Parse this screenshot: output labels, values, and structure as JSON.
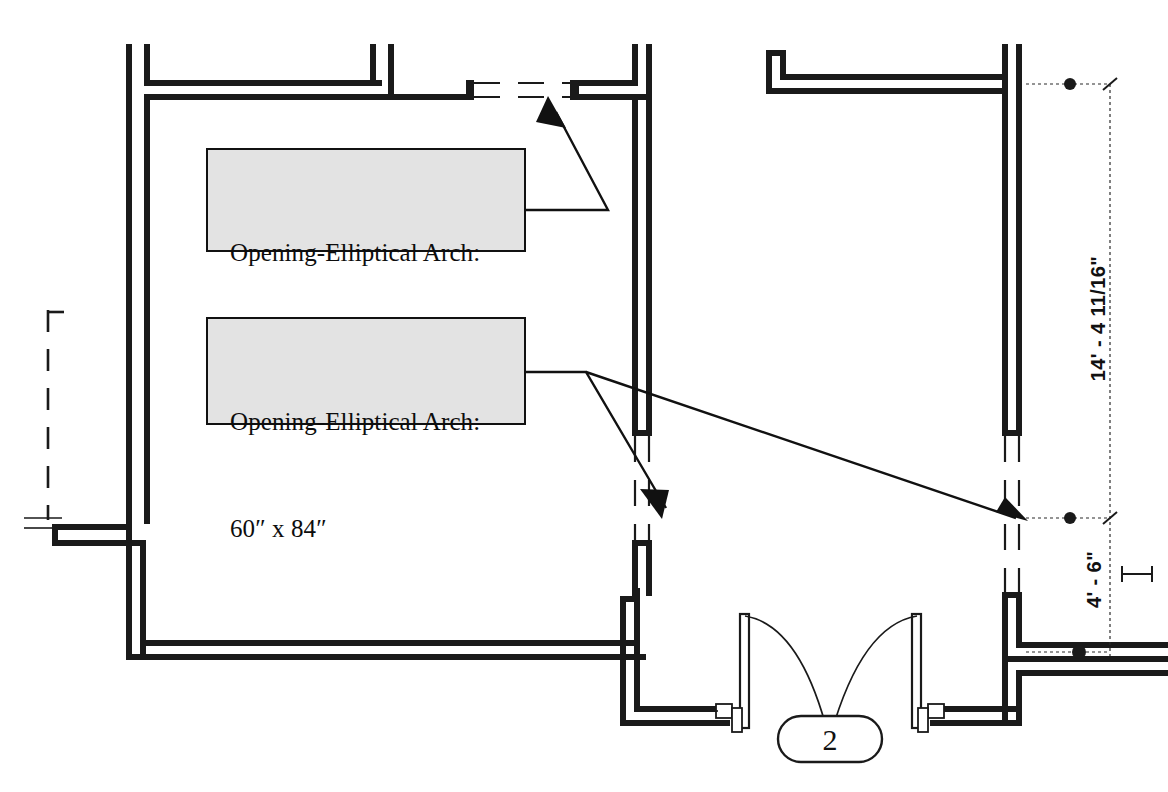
{
  "drawing": {
    "type": "architectural-floor-plan",
    "background_color": "#ffffff",
    "line_color": "#1a1a1a",
    "label_fill_color": "#e3e3e3"
  },
  "annotations": [
    {
      "id": "opening-36",
      "line1": "Opening-Elliptical Arch:",
      "line2": "36″ x 84″",
      "width_in": 36,
      "height_in": 84
    },
    {
      "id": "opening-60",
      "line1": "Opening-Elliptical Arch:",
      "line2": "60″ x 84″",
      "width_in": 60,
      "height_in": 84
    }
  ],
  "dimensions": [
    {
      "id": "dim-upper",
      "value": "14' - 4 11/16\""
    },
    {
      "id": "dim-lower",
      "value": "4' - 6\""
    }
  ],
  "callouts": [
    {
      "id": "door-tag",
      "value": "2"
    }
  ]
}
